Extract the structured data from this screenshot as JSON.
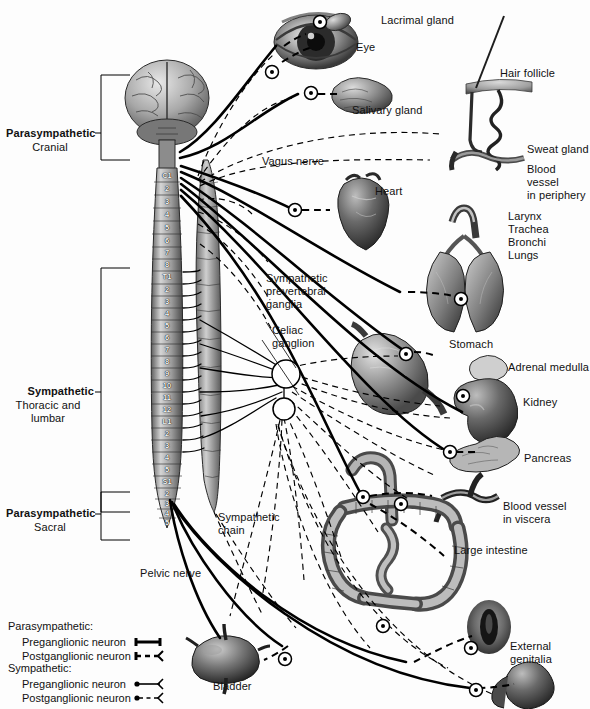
{
  "divisions": [
    {
      "name": "Parasympathetic",
      "sub": "Cranial"
    },
    {
      "name": "Sympathetic",
      "sub": "Thoracic and\nlumbar"
    },
    {
      "name": "Parasympathetic",
      "sub": "Sacral"
    }
  ],
  "spinal_segments": {
    "cervical": [
      "C1",
      "2",
      "3",
      "4",
      "5",
      "6",
      "7",
      "8"
    ],
    "thoracic": [
      "T1",
      "2",
      "3",
      "4",
      "5",
      "6",
      "7",
      "8",
      "9",
      "10",
      "11",
      "12"
    ],
    "lumbar": [
      "L1",
      "2",
      "3",
      "4",
      "5"
    ],
    "sacral": [
      "S1",
      "2",
      "3",
      "4",
      "5"
    ]
  },
  "organ_labels": [
    {
      "id": "lacrimal-gland",
      "text": "Lacrimal gland"
    },
    {
      "id": "eye",
      "text": "Eye"
    },
    {
      "id": "salivary-gland",
      "text": "Salivary gland"
    },
    {
      "id": "hair-follicle",
      "text": "Hair follicle"
    },
    {
      "id": "sweat-gland",
      "text": "Sweat gland"
    },
    {
      "id": "blood-vessel-periphery",
      "text": "Blood vessel\nin periphery"
    },
    {
      "id": "heart",
      "text": "Heart"
    },
    {
      "id": "respiratory",
      "text": "Larynx\nTrachea\nBronchi\nLungs"
    },
    {
      "id": "stomach",
      "text": "Stomach"
    },
    {
      "id": "adrenal-medulla",
      "text": "Adrenal medulla"
    },
    {
      "id": "kidney",
      "text": "Kidney"
    },
    {
      "id": "pancreas",
      "text": "Pancreas"
    },
    {
      "id": "blood-vessel-viscera",
      "text": "Blood vessel\nin viscera"
    },
    {
      "id": "large-intestine",
      "text": "Large intestine"
    },
    {
      "id": "external-genitalia",
      "text": "External\ngenitalia"
    },
    {
      "id": "bladder",
      "text": "Bladder"
    }
  ],
  "nerve_labels": [
    {
      "id": "vagus-nerve",
      "text": "Vagus nerve"
    },
    {
      "id": "sympathetic-prevertebral-ganglia",
      "text": "Sympathetic\nprevertebral\nganglia"
    },
    {
      "id": "celiac-ganglion",
      "text": "Celiac\nganglion"
    },
    {
      "id": "sympathetic-chain",
      "text": "Sympathetic\nchain"
    },
    {
      "id": "pelvic-nerve",
      "text": "Pelvic nerve"
    }
  ],
  "legend": {
    "groups": [
      {
        "heading": "Parasympathetic:",
        "rows": [
          {
            "label": "Preganglionic neuron",
            "style": "solid-thick"
          },
          {
            "label": "Postganglionic neuron",
            "style": "dashed-thick"
          }
        ]
      },
      {
        "heading": "Sympathetic:",
        "rows": [
          {
            "label": "Preganglionic neuron",
            "style": "solid-thin"
          },
          {
            "label": "Postganglionic neuron",
            "style": "dashed-thin"
          }
        ]
      }
    ]
  },
  "colors": {
    "ink": "#000000",
    "background": "#ffffff",
    "tissue_dark": "#3a3a3a",
    "tissue_mid": "#808080",
    "tissue_light": "#c9c9c9"
  }
}
